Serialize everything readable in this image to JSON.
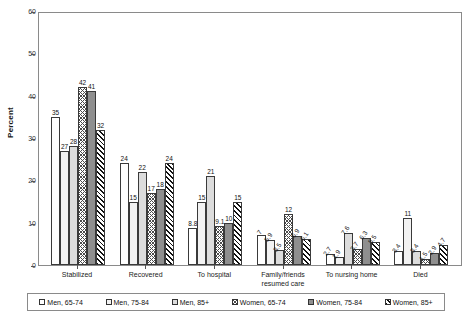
{
  "chart_data": {
    "type": "bar",
    "title": "",
    "xlabel": "",
    "ylabel": "Percent",
    "ylim": [
      0,
      60
    ],
    "yticks": [
      0,
      10,
      20,
      30,
      40,
      50,
      60
    ],
    "grid": false,
    "legend_position": "bottom",
    "categories": [
      "Stabilized",
      "Recovered",
      "To hospital",
      "Family/friends\nresumed care",
      "To nursing home",
      "Died"
    ],
    "series": [
      {
        "name": "Men, 65-74",
        "values": [
          35,
          24,
          8.8,
          7,
          2.7,
          3.4
        ],
        "labels": [
          "35",
          "24",
          "8.8",
          "7",
          "2.7",
          "3.4"
        ]
      },
      {
        "name": "Men, 75-84",
        "values": [
          27,
          15,
          15,
          5.9,
          1.9,
          11
        ],
        "labels": [
          "27",
          "15",
          "15",
          "5.9",
          "1.9",
          "11"
        ]
      },
      {
        "name": "Men, 85+",
        "values": [
          28,
          22,
          21,
          3.5,
          7.6,
          3.4
        ],
        "labels": [
          "28",
          "22",
          "21",
          "3.5",
          "7.6",
          "3.4"
        ]
      },
      {
        "name": "Women, 65-74",
        "values": [
          42,
          17,
          9.1,
          12,
          3.7,
          1.5
        ],
        "labels": [
          "42",
          "17",
          "9.1",
          "12",
          "3.7",
          "1.5"
        ]
      },
      {
        "name": "Women, 75-84",
        "values": [
          41,
          18,
          10,
          6.9,
          6.3,
          2.9
        ],
        "labels": [
          "41",
          "18",
          "10",
          "6.9",
          "6.3",
          "2.9"
        ]
      },
      {
        "name": "Women, 85+",
        "values": [
          32,
          24,
          15,
          6.1,
          5.5,
          4.7
        ],
        "labels": [
          "32",
          "24",
          "15",
          "6.1",
          "5.5",
          "4.7"
        ]
      }
    ]
  },
  "legend": {
    "items": [
      {
        "label": "Men, 65-74"
      },
      {
        "label": "Men, 75-84"
      },
      {
        "label": "Men, 85+"
      },
      {
        "label": "Women, 65-74"
      },
      {
        "label": "Women, 75-84"
      },
      {
        "label": "Women, 85+"
      }
    ]
  }
}
